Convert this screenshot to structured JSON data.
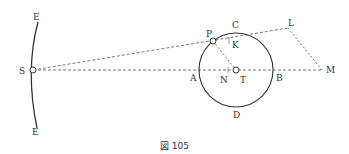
{
  "figure": {
    "caption": "図 105",
    "labels": {
      "E_top": "E",
      "E_bottom": "E",
      "S": "S",
      "P": "P",
      "C": "C",
      "K": "K",
      "L": "L",
      "A": "A",
      "N": "N",
      "T": "T",
      "B": "B",
      "M": "M",
      "D": "D"
    }
  }
}
